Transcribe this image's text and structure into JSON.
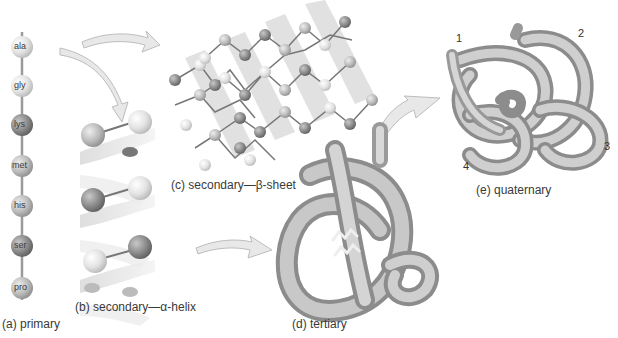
{
  "figure": {
    "panels": {
      "primary": {
        "label": "(a) primary",
        "residues": [
          "ala",
          "gly",
          "lys",
          "met",
          "his",
          "ser",
          "pro"
        ]
      },
      "alpha_helix": {
        "label": "(b) secondary—α-helix"
      },
      "beta_sheet": {
        "label": "(c) secondary—β-sheet"
      },
      "tertiary": {
        "label": "(d) tertiary"
      },
      "quaternary": {
        "label": "(e) quaternary",
        "subunits": [
          "1",
          "2",
          "3",
          "4"
        ]
      }
    },
    "colors": {
      "bead_light": "#e4e4e4",
      "bead_mid": "#b4b4b4",
      "bead_dark": "#8a8a8a",
      "arrow_fill": "#e8e8e8",
      "arrow_stroke": "#bdbdbd",
      "tube_light": "#d8d8d8",
      "tube_dark": "#8c8c8c"
    }
  }
}
